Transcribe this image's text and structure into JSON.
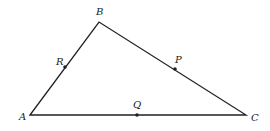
{
  "diagram": {
    "type": "triangle",
    "vertices": [
      {
        "name": "A",
        "x": 30,
        "y": 115,
        "label_x": 19,
        "label_y": 120
      },
      {
        "name": "B",
        "x": 99,
        "y": 22,
        "label_x": 96,
        "label_y": 15
      },
      {
        "name": "C",
        "x": 246,
        "y": 115,
        "label_x": 251,
        "label_y": 121
      }
    ],
    "points": [
      {
        "name": "R",
        "on_side": "AB",
        "x": 65,
        "y": 67,
        "label_x": 56,
        "label_y": 65
      },
      {
        "name": "P",
        "on_side": "BC",
        "x": 175,
        "y": 69,
        "label_x": 175,
        "label_y": 63
      },
      {
        "name": "Q",
        "on_side": "AC",
        "x": 137,
        "y": 115,
        "label_x": 133,
        "label_y": 108
      }
    ],
    "line_color": "#222222"
  }
}
